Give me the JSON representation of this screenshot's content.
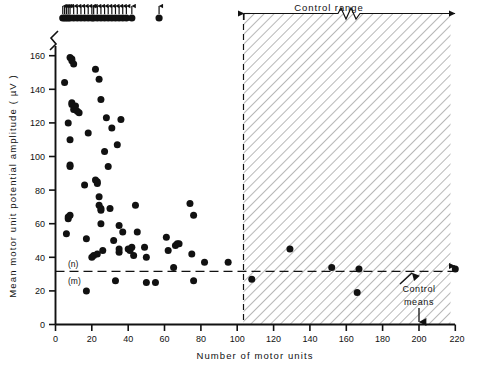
{
  "figure": {
    "background": "#ffffff",
    "ink": "#111111",
    "marker_color": "#111111"
  },
  "chart_data": {
    "type": "scatter",
    "title": "",
    "xlabel": "Number of motor units",
    "ylabel": "Mean motor unit potential amplitude  ( µV )",
    "xlim": [
      0,
      220
    ],
    "ylim": [
      0,
      178
    ],
    "xticks": [
      0,
      20,
      40,
      60,
      80,
      100,
      120,
      140,
      160,
      180,
      200,
      220
    ],
    "xticklabels": [
      "0",
      "20",
      "40",
      "60",
      "80",
      "100",
      "120",
      "140",
      "160",
      "180",
      "200",
      "220"
    ],
    "yticks": [
      0,
      20,
      40,
      60,
      80,
      100,
      120,
      140,
      160
    ],
    "yticklabels": [
      "0",
      "20",
      "40",
      "60",
      "80",
      "100",
      "120",
      "140",
      "160"
    ],
    "grid": false,
    "legend": null,
    "axis_break": {
      "axis": "y",
      "label": "y-axis-break",
      "above_value": 168,
      "note": "zigzag break above 160; points plotted above the break are off-scale"
    },
    "series": [
      {
        "name": "Patients (in-scale)",
        "marker": "filled-circle",
        "points": [
          [
            5,
            144
          ],
          [
            6,
            54
          ],
          [
            7,
            120
          ],
          [
            7,
            63
          ],
          [
            7,
            64
          ],
          [
            8,
            110
          ],
          [
            8,
            95
          ],
          [
            8,
            94
          ],
          [
            8,
            65
          ],
          [
            8,
            159
          ],
          [
            9,
            158
          ],
          [
            9,
            157
          ],
          [
            9,
            132
          ],
          [
            9,
            131
          ],
          [
            10,
            155
          ],
          [
            10,
            128
          ],
          [
            11,
            130
          ],
          [
            12,
            127
          ],
          [
            13,
            126
          ],
          [
            16,
            83
          ],
          [
            17,
            51
          ],
          [
            17,
            20
          ],
          [
            18,
            114
          ],
          [
            20,
            40
          ],
          [
            21,
            41
          ],
          [
            22,
            152
          ],
          [
            22,
            86
          ],
          [
            23,
            84
          ],
          [
            23,
            85
          ],
          [
            23,
            42
          ],
          [
            24,
            146
          ],
          [
            24,
            76
          ],
          [
            24,
            71
          ],
          [
            25,
            134
          ],
          [
            25,
            68
          ],
          [
            25,
            69
          ],
          [
            25,
            60
          ],
          [
            26,
            44
          ],
          [
            27,
            103
          ],
          [
            28,
            123
          ],
          [
            29,
            94
          ],
          [
            30,
            69
          ],
          [
            31,
            117
          ],
          [
            32,
            50
          ],
          [
            33,
            26
          ],
          [
            34,
            107
          ],
          [
            35,
            43
          ],
          [
            35,
            45
          ],
          [
            35,
            59
          ],
          [
            36,
            122
          ],
          [
            37,
            55
          ],
          [
            40,
            45
          ],
          [
            41,
            44
          ],
          [
            42,
            46
          ],
          [
            43,
            41
          ],
          [
            44,
            71
          ],
          [
            45,
            55
          ],
          [
            49,
            46
          ],
          [
            50,
            40
          ],
          [
            50,
            25
          ],
          [
            55,
            25
          ],
          [
            61,
            52
          ],
          [
            62,
            44
          ],
          [
            65,
            34
          ],
          [
            66,
            47
          ],
          [
            67,
            48
          ],
          [
            68,
            48
          ],
          [
            74,
            72
          ],
          [
            75,
            42
          ],
          [
            76,
            65
          ],
          [
            76,
            26
          ],
          [
            82,
            37
          ],
          [
            95,
            37
          ],
          [
            108,
            27
          ],
          [
            129,
            45
          ],
          [
            152,
            34
          ],
          [
            167,
            33
          ],
          [
            166,
            19
          ],
          [
            220,
            33
          ]
        ]
      },
      {
        "name": "Patients (off-scale, above break)",
        "marker": "filled-circle-with-up-arrow",
        "note": "amplitudes greater than the plotted scale; drawn as a row above the axis break",
        "x_values": [
          4,
          5,
          6,
          7,
          8,
          10,
          12,
          14,
          16,
          18,
          20,
          21,
          23,
          25,
          27,
          29,
          31,
          33,
          35,
          37,
          39,
          42,
          57
        ],
        "y_display": 173
      }
    ],
    "reference_lines": [
      {
        "name": "control-mean-line",
        "orientation": "horizontal",
        "value": 32,
        "style": "dashed",
        "labels": [
          "(n)",
          "(m)"
        ]
      },
      {
        "name": "control-range-boundary",
        "orientation": "vertical",
        "value": 120,
        "style": "dashed"
      }
    ],
    "shaded_regions": [
      {
        "name": "control-range-hatched",
        "x_from": 120,
        "x_to": 220,
        "fill": "diagonal-hatch",
        "label": "Control range"
      }
    ],
    "annotations": [
      {
        "name": "control-range-label",
        "text": "Control range"
      },
      {
        "name": "control-means-label",
        "text": "Control means"
      },
      {
        "name": "n-label",
        "text": "(n)"
      },
      {
        "name": "m-label",
        "text": "(m)"
      }
    ]
  },
  "labels": {
    "x_axis": "Number of motor units",
    "y_axis": "Mean motor unit potential amplitude  ( µV )",
    "control_range": "Control range",
    "control_means_line1": "Control",
    "control_means_line2": "means",
    "n_marker": "(n)",
    "m_marker": "(m)"
  }
}
